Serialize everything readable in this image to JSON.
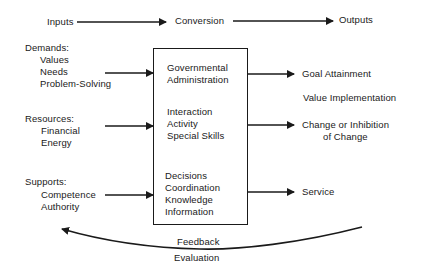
{
  "header": {
    "inputs": "Inputs",
    "conversion": "Conversion",
    "outputs": "Outputs"
  },
  "inputs": [
    {
      "title": "Demands:",
      "items": [
        "Values",
        "Needs",
        "Problem-Solving"
      ]
    },
    {
      "title": "Resources:",
      "items": [
        "Financial",
        "Energy"
      ]
    },
    {
      "title": "Supports:",
      "items": [
        "Competence",
        "Authority"
      ]
    }
  ],
  "conversion_box": [
    {
      "lines": [
        "Governmental",
        "Administration"
      ]
    },
    {
      "lines": [
        "Interaction",
        "Activity",
        "Special Skills"
      ]
    },
    {
      "lines": [
        "Decisions",
        "Coordination",
        "Knowledge",
        "Information"
      ]
    }
  ],
  "outputs": [
    {
      "label": "Goal Attainment"
    },
    {
      "label": "Value Implementation"
    },
    {
      "label_line1": "Change or Inhibition",
      "label_line2": "of Change"
    },
    {
      "label": "Service"
    }
  ],
  "feedback": {
    "label1": "Feedback",
    "label2": "Evaluation"
  }
}
